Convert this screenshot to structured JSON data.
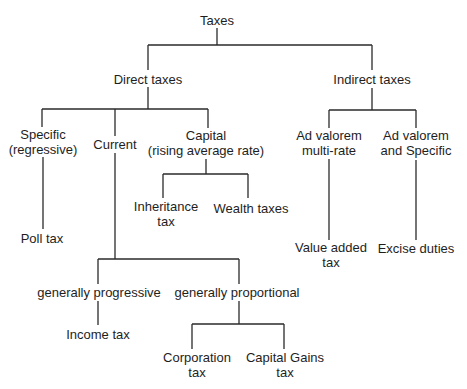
{
  "diagram": {
    "root": {
      "label": "Taxes"
    },
    "direct": {
      "label": "Direct taxes",
      "specific": {
        "line1": "Specific",
        "line2": "(regressive)",
        "child": "Poll tax"
      },
      "current": {
        "label": "Current",
        "progressive": {
          "label": "generally progressive",
          "child": "Income tax"
        },
        "proportional": {
          "label": "generally proportional",
          "corporation": {
            "line1": "Corporation",
            "line2": "tax"
          },
          "capital_gains": {
            "line1": "Capital Gains",
            "line2": "tax"
          }
        }
      },
      "capital": {
        "line1": "Capital",
        "line2": "(rising average rate)",
        "inheritance": {
          "line1": "Inheritance",
          "line2": "tax"
        },
        "wealth": {
          "label": "Wealth taxes"
        }
      }
    },
    "indirect": {
      "label": "Indirect taxes",
      "multi_rate": {
        "line1": "Ad valorem",
        "line2": "multi-rate",
        "child1": "Value added",
        "child2": "tax"
      },
      "ad_specific": {
        "line1": "Ad valorem",
        "line2": "and Specific",
        "child": "Excise duties"
      }
    },
    "colors": {
      "line": "#2a2a2a",
      "text": "#1e1e1e",
      "background": "#ffffff"
    }
  }
}
